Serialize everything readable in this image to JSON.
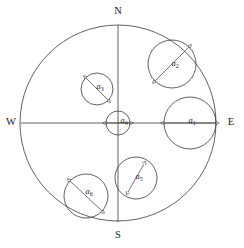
{
  "figure": {
    "background_color": "#ffffff",
    "stroke_color": "#3a3a3a",
    "text_color": "#1a1a1a",
    "width": 244,
    "height": 248
  },
  "boundary_circle": {
    "name": "outer-boundary-circle",
    "cx": 118,
    "cy": 123,
    "r": 98
  },
  "axes": {
    "horizontal": {
      "name": "west-east-axis",
      "x1": 21,
      "y1": 123,
      "x2": 216,
      "y2": 123
    },
    "vertical": {
      "name": "north-south-axis",
      "x1": 118,
      "y1": 25,
      "x2": 118,
      "y2": 222
    }
  },
  "cardinal_labels": [
    {
      "id": "north",
      "text": "N",
      "x": 118,
      "y": 12
    },
    {
      "id": "south",
      "text": "S",
      "x": 118,
      "y": 236
    },
    {
      "id": "west",
      "text": "W",
      "x": 11,
      "y": 123
    },
    {
      "id": "east",
      "text": "E",
      "x": 231,
      "y": 123
    }
  ],
  "inner_circles": [
    {
      "id": "a1",
      "label": "a",
      "subscript": "1",
      "cx": 190,
      "cy": 123,
      "r": 26,
      "label_x": 192,
      "label_y": 121,
      "arrow": {
        "x1": 164,
        "y1": 123,
        "x2": 216,
        "y2": 123
      }
    },
    {
      "id": "a2",
      "label": "a",
      "subscript": "2",
      "cx": 172,
      "cy": 64,
      "r": 24,
      "label_x": 175,
      "label_y": 64,
      "arrow": {
        "x1": 155,
        "y1": 81,
        "x2": 189,
        "y2": 47
      }
    },
    {
      "id": "a3",
      "label": "a",
      "subscript": "3",
      "cx": 97,
      "cy": 89,
      "r": 16,
      "label_x": 100,
      "label_y": 87,
      "arrow": {
        "x1": 86,
        "y1": 78,
        "x2": 108,
        "y2": 100
      }
    },
    {
      "id": "a4",
      "label": "a",
      "subscript": "4",
      "cx": 118,
      "cy": 123,
      "r": 12,
      "label_x": 124,
      "label_y": 121,
      "arrow": {
        "x1": 106,
        "y1": 123,
        "x2": 130,
        "y2": 123
      }
    },
    {
      "id": "a5",
      "label": "a",
      "subscript": "5",
      "cx": 136,
      "cy": 178,
      "r": 21,
      "label_x": 139,
      "label_y": 177,
      "arrow": {
        "x1": 128,
        "y1": 192,
        "x2": 144,
        "y2": 164
      }
    },
    {
      "id": "a6",
      "label": "a",
      "subscript": "6",
      "cx": 86,
      "cy": 196,
      "r": 22,
      "label_x": 89,
      "label_y": 192,
      "arrow": {
        "x1": 70,
        "y1": 181,
        "x2": 102,
        "y2": 211
      }
    }
  ],
  "legend": {
    "description": "Six inscribed circles labeled a1 through a6 with double-headed diameter arrows"
  }
}
